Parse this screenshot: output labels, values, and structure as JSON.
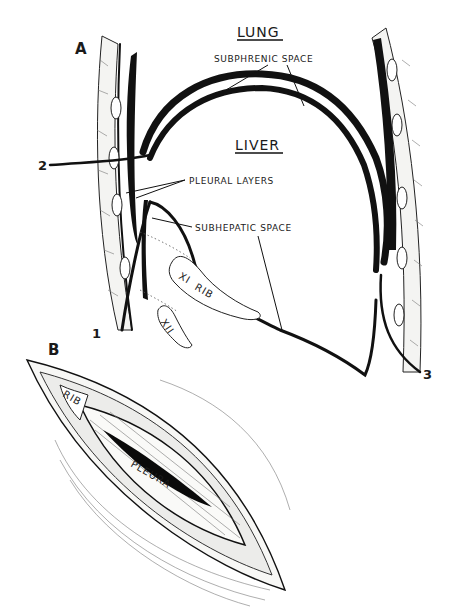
{
  "figure": {
    "panel_a": {
      "label": "A",
      "organs": {
        "upper": "LUNG",
        "lower": "LIVER"
      },
      "annotations": {
        "subphrenic": "SUBPHRENIC SPACE",
        "pleural": "PLEURAL LAYERS",
        "subhepatic": "SUBHEPATIC SPACE"
      },
      "ribs": {
        "xi": "XI",
        "xi_word": "RIB",
        "xii": "XII"
      },
      "approaches": [
        "1",
        "2",
        "3"
      ]
    },
    "panel_b": {
      "label": "B",
      "rib_label": "RIB",
      "pleura_label": "PLEURA"
    }
  }
}
